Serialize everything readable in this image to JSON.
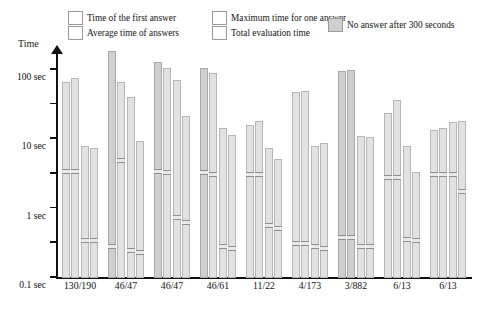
{
  "legend": {
    "items": [
      {
        "label": "Time of the first answer",
        "swatch": "#e2e2e2",
        "x": 68,
        "y": 11
      },
      {
        "label": "Average time of answers",
        "swatch": "#e2e2e2",
        "x": 68,
        "y": 26
      },
      {
        "label": "Maximum time for one answer",
        "swatch": "#e2e2e2",
        "x": 200,
        "y": 11
      },
      {
        "label": "Total evaluation time",
        "swatch": "#e2e2e2",
        "x": 200,
        "y": 26
      },
      {
        "label": "No answer after 300 seconds",
        "swatch": "#cfcfcf",
        "x": 328,
        "y": 18
      }
    ]
  },
  "axis": {
    "y_title": "Time",
    "y_ticks": [
      "100 sec",
      "10 sec",
      "1 sec",
      "0.1 sec",
      "10 ms",
      "1 ms",
      "0.1 ms"
    ],
    "y_tick_values": [
      100,
      10,
      1,
      0.1,
      0.01,
      0.001,
      0.0001
    ]
  },
  "chart_data": {
    "type": "bar",
    "title": "",
    "xlabel": "",
    "ylabel": "Time",
    "yscale": "log",
    "ylim": [
      0.0001,
      300
    ],
    "grid": false,
    "legend_position": "top",
    "categories": [
      "130/190",
      "46/47",
      "46/47",
      "46/61",
      "11/22",
      "4/173",
      "3/882",
      "6/13",
      "6/13"
    ],
    "series": [
      {
        "name": "Time of the first answer",
        "values": [
          40,
          300,
          150,
          100,
          2.2,
          20,
          80,
          5,
          1.6
        ]
      },
      {
        "name": "Average time of answers",
        "values": [
          50,
          40,
          100,
          70,
          3,
          22,
          90,
          12,
          1.8
        ]
      },
      {
        "name": "Maximum time for one answer",
        "values": [
          0.55,
          15,
          45,
          1.8,
          0.5,
          0.55,
          1.1,
          0.55,
          2.8
        ]
      },
      {
        "name": "Total evaluation time",
        "values": [
          0.5,
          0.8,
          4,
          1.2,
          0.24,
          0.7,
          1.0,
          0.1,
          3.0
        ]
      }
    ],
    "capped_series_note": "Dark gray bars indicate no answer after 300 seconds",
    "capped": [
      [
        false,
        false,
        false,
        false
      ],
      [
        true,
        false,
        false,
        false
      ],
      [
        true,
        false,
        false,
        false
      ],
      [
        true,
        false,
        false,
        false
      ],
      [
        false,
        false,
        false,
        false
      ],
      [
        false,
        false,
        false,
        false
      ],
      [
        true,
        true,
        false,
        false
      ],
      [
        false,
        false,
        false,
        false
      ],
      [
        false,
        false,
        false,
        false
      ]
    ],
    "markers": [
      [
        0.13,
        0.13,
        0.0013,
        0.0013
      ],
      [
        0.0009,
        0.28,
        0.0007,
        0.0006
      ],
      [
        0.13,
        0.12,
        0.006,
        0.0045
      ],
      [
        0.12,
        0.11,
        0.0009,
        0.0008
      ],
      [
        0.11,
        0.11,
        0.0035,
        0.003
      ],
      [
        0.0011,
        0.0011,
        0.0009,
        0.0008
      ],
      [
        0.0016,
        0.0016,
        0.0009,
        0.0009
      ],
      [
        0.085,
        0.085,
        0.0014,
        0.0013
      ],
      [
        0.11,
        0.11,
        0.11,
        0.035
      ]
    ]
  }
}
